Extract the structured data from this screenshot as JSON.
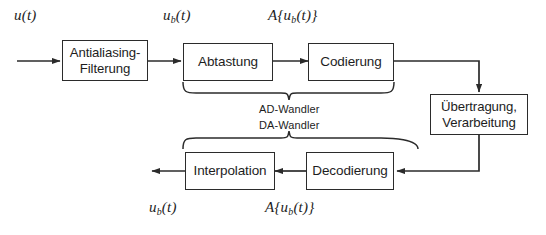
{
  "figure": {
    "type": "block-diagram",
    "background": "#ffffff",
    "stroke_color": "#2b2b2b",
    "text_color": "#1d1d1d"
  },
  "blocks": [
    {
      "id": "antialiasing",
      "line1": "Antialiasing-",
      "line2": "Filterung"
    },
    {
      "id": "abtastung",
      "line1": "Abtastung",
      "line2": ""
    },
    {
      "id": "codierung",
      "line1": "Codierung",
      "line2": ""
    },
    {
      "id": "uebertragung",
      "line1": "Übertragung,",
      "line2": "Verarbeitung"
    },
    {
      "id": "interpolation",
      "line1": "Interpolation",
      "line2": ""
    },
    {
      "id": "decodierung",
      "line1": "Decodierung",
      "line2": ""
    }
  ],
  "signal_labels": {
    "input_top": {
      "base": "u",
      "sub": "",
      "arg": "(t)"
    },
    "filtered_top": {
      "base": "u",
      "sub": "b",
      "arg": "(t)"
    },
    "quantized_top": {
      "base": "A",
      "sub": "b",
      "arg": "(t)"
    },
    "output_bottom": {
      "base": "u",
      "sub": "b",
      "arg": "(t)"
    },
    "quantized_bottom": {
      "base": "A",
      "sub": "b",
      "arg": "(t)"
    }
  },
  "brace_labels": {
    "ad_converter": "AD-Wandler",
    "da_converter": "DA-Wandler"
  }
}
